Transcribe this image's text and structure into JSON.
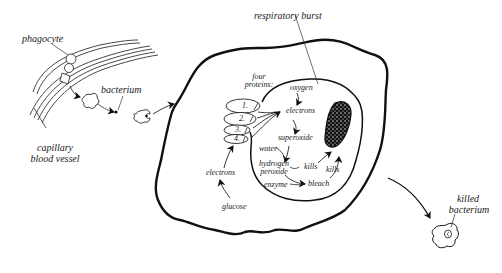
{
  "diagram": {
    "labels": {
      "phagocyte": "phagocyte",
      "bacterium": "bacterium",
      "capillary_line1": "capillary",
      "capillary_line2": "blood vessel",
      "respiratory_burst": "respiratory burst",
      "four_proteins_line1": "four",
      "four_proteins_line2": "proteins:",
      "protein_1": "1.",
      "protein_2": "2.",
      "protein_3": "3.",
      "protein_4": "4.",
      "oxygen": "oxygen",
      "electrons_inner": "electrons",
      "superoxide": "superoxide",
      "water": "water",
      "hydrogen_peroxide_line1": "hydrogen",
      "hydrogen_peroxide_line2": "peroxide",
      "kills_1": "kills",
      "kills_2": "kills",
      "enzyme": "enzyme",
      "bleach": "bleach",
      "electrons_outer": "electrons",
      "glucose": "glucose",
      "killed_line1": "killed",
      "killed_line2": "bacterium"
    },
    "colors": {
      "ink": "#111111",
      "background": "#ffffff"
    }
  }
}
